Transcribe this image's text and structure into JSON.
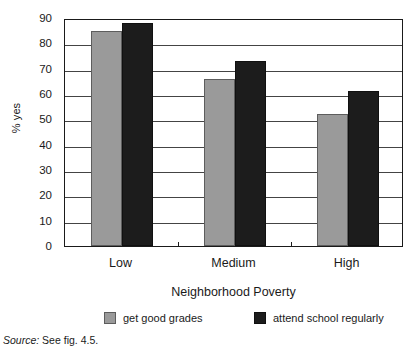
{
  "chart_data": {
    "type": "bar",
    "title": "",
    "xlabel": "Neighborhood Poverty",
    "ylabel": "% yes",
    "ylim": [
      0,
      90
    ],
    "ytick_step": 10,
    "yticks": [
      90,
      80,
      70,
      60,
      50,
      40,
      30,
      20,
      10,
      0
    ],
    "grid": true,
    "legend_position": "bottom",
    "categories": [
      "Low",
      "Medium",
      "High"
    ],
    "series": [
      {
        "name": "get good grades",
        "color": "#9a9a9a",
        "values": [
          85,
          66,
          52
        ]
      },
      {
        "name": "attend school regularly",
        "color": "#1c1c1c",
        "values": [
          88,
          73,
          61
        ]
      }
    ]
  },
  "source_note": {
    "label": "Source:",
    "text": "See fig. 4.5."
  },
  "colors": {
    "axis": "#1a1a1a",
    "gridline": "#444444",
    "background": "#ffffff",
    "series_light": "#9a9a9a",
    "series_dark": "#1c1c1c"
  }
}
